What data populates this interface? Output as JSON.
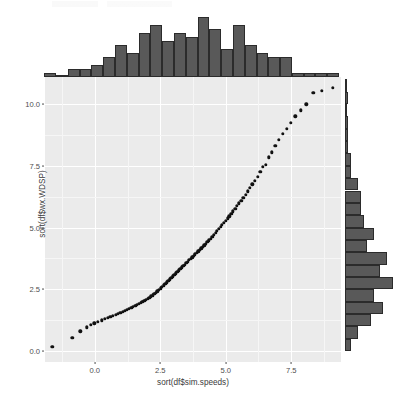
{
  "figure": {
    "kind": "scatterplot-with-marginal-histograms",
    "panel_background": "#ebebeb",
    "gridline_color": "#ffffff",
    "point_color": "#111111",
    "histogram_fill": "#595959",
    "histogram_border": "#2b2b2b"
  },
  "axes": {
    "ylabel": "sort(df$wx.WDSP)",
    "xlabel": "sort(df$sim.speeds)",
    "ytick_labels": [
      "0.0",
      "2.5",
      "5.0",
      "7.5",
      "10.0"
    ],
    "ytick_values": [
      0.0,
      2.5,
      5.0,
      7.5,
      10.0
    ],
    "xtick_labels": [
      "0.0",
      "2.5",
      "5.0",
      "7.5"
    ],
    "xtick_values": [
      0.0,
      2.5,
      5.0,
      7.5
    ]
  },
  "chart_data": {
    "type": "scatter",
    "title": "",
    "xlabel": "sort(df$sim.speeds)",
    "ylabel": "sort(df$wx.WDSP)",
    "xlim": [
      -1.9,
      9.4
    ],
    "ylim": [
      -0.45,
      11.1
    ],
    "grid": true,
    "legend": null,
    "xticks": [
      0.0,
      2.5,
      5.0,
      7.5
    ],
    "yticks": [
      0.0,
      2.5,
      5.0,
      7.5,
      10.0
    ],
    "x": [
      -1.62,
      -0.86,
      -0.55,
      -0.3,
      -0.16,
      -0.02,
      0.12,
      0.26,
      0.38,
      0.49,
      0.6,
      0.7,
      0.8,
      0.89,
      0.98,
      1.07,
      1.15,
      1.23,
      1.31,
      1.39,
      1.46,
      1.54,
      1.61,
      1.68,
      1.75,
      1.82,
      1.89,
      1.95,
      2.02,
      2.08,
      2.15,
      2.21,
      2.27,
      2.33,
      2.39,
      2.45,
      2.51,
      2.57,
      2.63,
      2.69,
      2.75,
      2.81,
      2.87,
      2.92,
      2.98,
      3.04,
      3.09,
      3.15,
      3.21,
      3.26,
      3.32,
      3.38,
      3.43,
      3.49,
      3.55,
      3.6,
      3.66,
      3.72,
      3.77,
      3.83,
      3.89,
      3.95,
      4.0,
      4.06,
      4.12,
      4.18,
      4.24,
      4.3,
      4.36,
      4.42,
      4.48,
      4.54,
      4.61,
      4.67,
      4.73,
      4.8,
      4.86,
      4.93,
      5.0,
      5.07,
      5.14,
      5.21,
      5.28,
      5.36,
      5.43,
      5.51,
      5.59,
      5.67,
      5.76,
      5.84,
      5.93,
      6.02,
      6.12,
      6.22,
      6.32,
      6.42,
      6.53,
      6.65,
      6.77,
      6.89,
      7.03,
      7.17,
      7.32,
      7.48,
      7.66,
      7.86,
      8.08,
      8.34,
      8.66,
      9.08
    ],
    "y": [
      0.16,
      0.52,
      0.8,
      0.95,
      1.05,
      1.12,
      1.18,
      1.24,
      1.29,
      1.33,
      1.38,
      1.42,
      1.46,
      1.5,
      1.54,
      1.58,
      1.62,
      1.66,
      1.7,
      1.74,
      1.78,
      1.82,
      1.86,
      1.9,
      1.94,
      1.98,
      2.02,
      2.07,
      2.11,
      2.16,
      2.21,
      2.26,
      2.31,
      2.36,
      2.42,
      2.48,
      2.54,
      2.6,
      2.66,
      2.72,
      2.78,
      2.84,
      2.9,
      2.96,
      3.02,
      3.08,
      3.14,
      3.2,
      3.26,
      3.32,
      3.38,
      3.44,
      3.5,
      3.56,
      3.62,
      3.68,
      3.74,
      3.8,
      3.86,
      3.92,
      3.98,
      4.04,
      4.1,
      4.16,
      4.22,
      4.28,
      4.34,
      4.41,
      4.48,
      4.55,
      4.62,
      4.7,
      4.78,
      4.86,
      4.94,
      5.02,
      5.1,
      5.19,
      5.28,
      5.37,
      5.46,
      5.56,
      5.66,
      5.76,
      5.87,
      5.98,
      6.09,
      6.21,
      6.33,
      6.46,
      6.6,
      6.75,
      6.9,
      7.06,
      7.25,
      7.45,
      7.55,
      7.85,
      8.05,
      8.3,
      8.55,
      8.8,
      9.0,
      9.25,
      9.5,
      9.75,
      10.0,
      10.45,
      10.55,
      10.65
    ],
    "marginal_top": {
      "type": "bar",
      "orientation": "vertical",
      "description": "marginal histogram of sort(df$sim.speeds)",
      "bin_centers": [
        -1.7,
        -1.25,
        -0.8,
        -0.35,
        0.1,
        0.55,
        1.0,
        1.45,
        1.9,
        2.35,
        2.8,
        3.25,
        3.7,
        4.15,
        4.6,
        5.05,
        5.5,
        5.95,
        6.4,
        6.85,
        7.3,
        7.75,
        8.2,
        8.65,
        9.1
      ],
      "values": [
        1,
        0,
        2,
        2,
        3,
        5,
        8,
        6,
        11,
        13,
        9,
        11,
        10,
        15,
        12,
        7,
        13,
        8,
        6,
        5,
        5,
        1,
        1,
        1,
        1
      ]
    },
    "marginal_right": {
      "type": "bar",
      "orientation": "horizontal",
      "description": "marginal histogram of sort(df$wx.WDSP)",
      "bin_centers": [
        0.25,
        0.75,
        1.25,
        1.75,
        2.25,
        2.75,
        3.25,
        3.75,
        4.25,
        4.75,
        5.25,
        5.75,
        6.25,
        6.75,
        7.25,
        7.75,
        8.25,
        8.75,
        9.25,
        9.75,
        10.25,
        10.75
      ],
      "values": [
        2,
        4,
        8,
        12,
        9,
        15,
        11,
        13,
        7,
        9,
        6,
        5,
        5,
        4,
        2,
        2,
        1,
        1,
        1,
        0,
        1,
        0
      ]
    }
  }
}
